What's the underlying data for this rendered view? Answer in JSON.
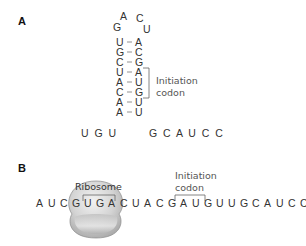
{
  "panel_a": {
    "label": "A",
    "loop": {
      "g": "G",
      "a": "A",
      "c": "C",
      "u": "U"
    },
    "stem_pairs": [
      {
        "left": "U",
        "right": "A"
      },
      {
        "left": "G",
        "right": "C"
      },
      {
        "left": "C",
        "right": "G"
      },
      {
        "left": "U",
        "right": "A"
      },
      {
        "left": "A",
        "right": "U"
      },
      {
        "left": "C",
        "right": "G"
      },
      {
        "left": "A",
        "right": "U"
      },
      {
        "left": "A",
        "right": "U"
      }
    ],
    "pair_symbol": "-",
    "five_prime_tail": "U G U",
    "three_prime_tail": "G C A U C C",
    "initiation_codon_label_line1": "Initiation",
    "initiation_codon_label_line2": "codon"
  },
  "panel_b": {
    "label": "B",
    "ribosome_label": "Ribosome",
    "sequence": [
      "A",
      "U",
      "C",
      "G",
      "U",
      "G",
      "A",
      "C",
      "U",
      "A",
      "C",
      "G",
      "A",
      "U",
      "G",
      "U",
      "U",
      "G",
      "C",
      "A",
      "U",
      "C",
      "C"
    ],
    "initiation_codon_label_line1": "Initiation",
    "initiation_codon_label_line2": "codon"
  },
  "colors": {
    "text": "#333333",
    "ribosome_fill": "#cfcfcf",
    "ribosome_highlight": "#eeeeee"
  }
}
